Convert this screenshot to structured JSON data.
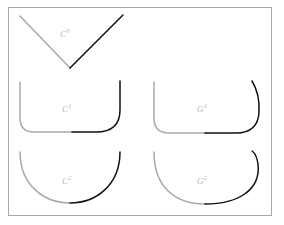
{
  "figure": {
    "background_color": "#ffffff",
    "border": {
      "name": "figure-frame",
      "color": "#a8a8a8",
      "width": 1,
      "x": 8,
      "y": 7,
      "w": 264,
      "h": 209
    },
    "stroke_colors": {
      "gray": "#a9a9a9",
      "black": "#111111",
      "label": "#b6b6b6"
    },
    "stroke_width": 1.5,
    "panels": [
      {
        "id": "c0",
        "label_text": "C",
        "label_sup": "0",
        "label_full": "C⁰",
        "label_x": 60,
        "label_y": 29,
        "gray_path": "M 20 16 L 70 68",
        "black_path": "M 70 68 L 123 15"
      },
      {
        "id": "c1",
        "label_text": "C",
        "label_sup": "1",
        "label_full": "C¹",
        "label_x": 62,
        "label_y": 104,
        "gray_path": "M 20 82 L 20 118 Q 20 132 34 132 L 72 132",
        "black_path": "M 72 132 L 96 132 Q 120 132 120 110 L 120 81"
      },
      {
        "id": "g1",
        "label_text": "G",
        "label_sup": "1",
        "label_full": "G¹",
        "label_x": 197,
        "label_y": 104,
        "gray_path": "M 154 82 L 154 118 Q 154 133 169 133 L 205 133",
        "black_path": "M 205 133 L 236 133 Q 258 133 259 112 Q 260 94 252 81"
      },
      {
        "id": "c2",
        "label_text": "C",
        "label_sup": "2",
        "label_full": "C²",
        "label_x": 62,
        "label_y": 176,
        "gray_path": "M 20 152 C 20 185 44 203 70 203",
        "black_path": "M 70 203 C 96 203 120 185 120 152"
      },
      {
        "id": "g2",
        "label_text": "G",
        "label_sup": "2",
        "label_full": "G²",
        "label_x": 197,
        "label_y": 176,
        "gray_path": "M 154 152 C 154 188 176 204 205 204",
        "black_path": "M 205 204 C 238 204 261 190 258 164 C 257 157 255 153 252 151"
      }
    ]
  }
}
